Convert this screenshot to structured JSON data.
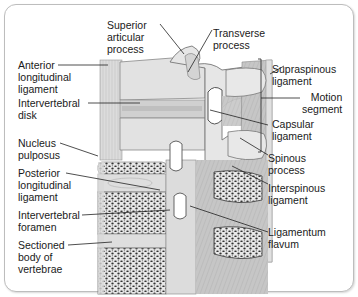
{
  "diagram": {
    "labels": {
      "superior_articular_process": "Superior\narticular\nprocess",
      "transverse_process": "Transverse\nprocess",
      "anterior_longitudinal_ligament": "Anterior\nlongitudinal\nligament",
      "supraspinous_ligament": "Supraspinous\nligament",
      "motion_segment": "Motion\nsegment",
      "intervertebral_disk": "Intervertebral\ndisk",
      "capsular_ligament": "Capsular\nligament",
      "nucleus_pulposus": "Nucleus\npulposus",
      "spinous_process": "Spinous\nprocess",
      "posterior_longitudinal_ligament": "Posterior\nlongitudinal\nligament",
      "interspinous_ligament": "Interspinous\nligament",
      "intervertebral_foramen": "Intervertebral\nforamen",
      "ligamentum_flavum": "Ligamentum\nflavum",
      "sectioned_body_of_vertebrae": "Sectioned\nbody of\nvertebrae"
    },
    "colors": {
      "bone": "#e4e4e4",
      "bone_shade": "#b9b9b9",
      "ligament": "#c8c8c8",
      "cancellous": "#2a2a2a",
      "leader_line": "#222222",
      "frame": "#bdbdbd"
    }
  }
}
